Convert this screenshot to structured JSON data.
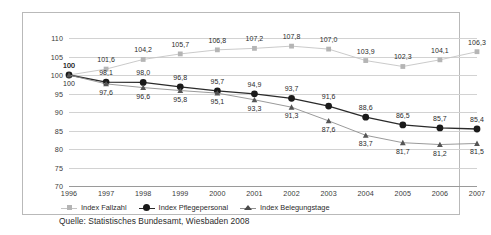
{
  "chart_data": {
    "type": "line",
    "title": "",
    "xlabel": "",
    "ylabel": "",
    "ylim": [
      70,
      110
    ],
    "yticks": [
      70,
      75,
      80,
      85,
      90,
      95,
      100,
      105,
      110
    ],
    "grid": true,
    "legend_position": "bottom-left",
    "categories": [
      "1996",
      "1997",
      "1998",
      "1999",
      "2000",
      "2001",
      "2002",
      "2003",
      "2004",
      "2005",
      "2006",
      "2007"
    ],
    "series": [
      {
        "name": "Index Fallzahl",
        "marker": "square",
        "color": "#b5b5b5",
        "values": [
          100,
          101.6,
          104.2,
          105.7,
          106.8,
          107.2,
          107.8,
          107.0,
          103.9,
          102.3,
          104.1,
          106.3
        ],
        "labels": [
          "100",
          "101,6",
          "104,2",
          "105,7",
          "106,8",
          "107,2",
          "107,8",
          "107,0",
          "103,9",
          "102,3",
          "104,1",
          "106,3"
        ]
      },
      {
        "name": "Index Pflegepersonal",
        "marker": "circle",
        "color": "#1a1a1a",
        "values": [
          100,
          98.1,
          98.0,
          96.8,
          95.7,
          94.9,
          93.7,
          91.6,
          88.6,
          86.5,
          85.7,
          85.4
        ],
        "labels": [
          "100",
          "98,1",
          "98,0",
          "96,8",
          "95,7",
          "94,9",
          "93,7",
          "91,6",
          "88,6",
          "86,5",
          "85,7",
          "85,4"
        ]
      },
      {
        "name": "Index Belegungstage",
        "marker": "triangle",
        "color": "#555555",
        "values": [
          100,
          97.6,
          96.6,
          95.8,
          95.1,
          93.3,
          91.3,
          87.6,
          83.7,
          81.7,
          81.2,
          81.5
        ],
        "labels": [
          "100",
          "97,6",
          "96,6",
          "95,8",
          "95,1",
          "93,3",
          "91,3",
          "87,6",
          "83,7",
          "81,7",
          "81,2",
          "81,5"
        ]
      }
    ]
  },
  "legend": {
    "items": [
      {
        "label": "Index Fallzahl"
      },
      {
        "label": "Index Pflegepersonal"
      },
      {
        "label": "Index Belegungstage"
      }
    ]
  },
  "source": {
    "text": "Quelle: Statistisches Bundesamt, Wiesbaden 2008"
  }
}
